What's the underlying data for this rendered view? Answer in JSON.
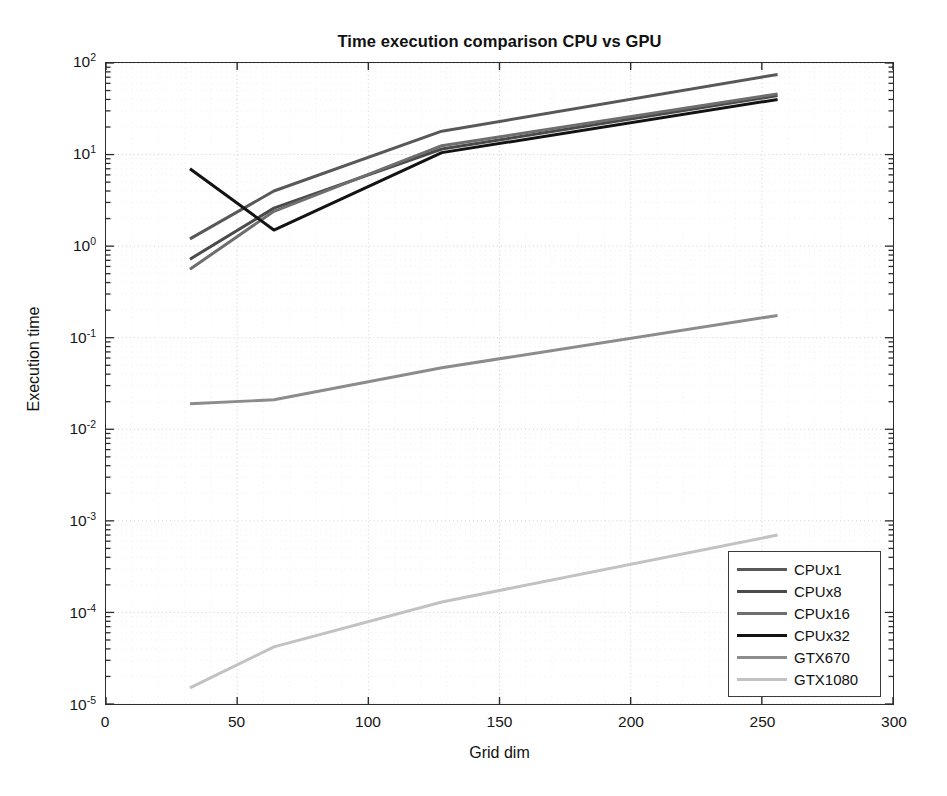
{
  "chart_data": {
    "type": "line",
    "title": "Time execution comparison CPU vs GPU",
    "xlabel": "Grid dim",
    "ylabel": "Execution time",
    "xscale": "linear",
    "yscale": "log",
    "xlim": [
      0,
      300
    ],
    "ylim": [
      1e-05,
      100
    ],
    "xticks": [
      0,
      50,
      100,
      150,
      200,
      250,
      300
    ],
    "xtick_labels": [
      "0",
      "50",
      "100",
      "150",
      "200",
      "250",
      "300"
    ],
    "yticks": [
      1e-05,
      0.0001,
      0.001,
      0.01,
      0.1,
      1,
      10,
      100
    ],
    "ytick_labels": [
      "10-5",
      "10-4",
      "10-3",
      "10-2",
      "10-1",
      "100",
      "101",
      "102"
    ],
    "ytick_mantissa": [
      "10",
      "10",
      "10",
      "10",
      "10",
      "10",
      "10",
      "10"
    ],
    "ytick_exponent": [
      "-5",
      "-4",
      "-3",
      "-2",
      "-1",
      "0",
      "1",
      "2"
    ],
    "grid": true,
    "grid_style": "dotted-minor-and-major",
    "legend_position": "lower right",
    "x": [
      32,
      64,
      128,
      256
    ],
    "series": [
      {
        "name": "CPUx1",
        "color": "#585858",
        "width": 3.0,
        "values": [
          1.2,
          4.0,
          18.0,
          75.0
        ]
      },
      {
        "name": "CPUx8",
        "color": "#4a4a4a",
        "width": 3.0,
        "values": [
          0.72,
          2.6,
          11.5,
          44.0
        ]
      },
      {
        "name": "CPUx16",
        "color": "#6e6e6e",
        "width": 3.0,
        "values": [
          0.56,
          2.4,
          12.5,
          46.0
        ]
      },
      {
        "name": "CPUx32",
        "color": "#131313",
        "width": 3.0,
        "values": [
          7.0,
          1.5,
          10.5,
          40.0
        ]
      },
      {
        "name": "GTX670",
        "color": "#8c8c8c",
        "width": 3.0,
        "values": [
          0.019,
          0.021,
          0.047,
          0.175
        ]
      },
      {
        "name": "GTX1080",
        "color": "#c2c2c2",
        "width": 3.0,
        "values": [
          1.5e-05,
          4.2e-05,
          0.00013,
          0.0007
        ]
      }
    ]
  },
  "legend": {
    "items": [
      {
        "label": "CPUx1"
      },
      {
        "label": "CPUx8"
      },
      {
        "label": "CPUx16"
      },
      {
        "label": "CPUx32"
      },
      {
        "label": "GTX670"
      },
      {
        "label": "GTX1080"
      }
    ]
  },
  "colors": {
    "axis": "#2b2b2b",
    "grid": "#d8d8d8",
    "background": "#ffffff",
    "text": "#111111"
  }
}
